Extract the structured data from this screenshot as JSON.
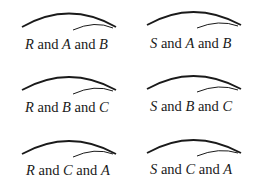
{
  "diagram": {
    "cells": [
      {
        "first": "R",
        "joiner1": " and ",
        "second": "A",
        "joiner2": " and ",
        "third": "B"
      },
      {
        "first": "S",
        "joiner1": " and ",
        "second": "A",
        "joiner2": " and ",
        "third": "B"
      },
      {
        "first": "R",
        "joiner1": " and ",
        "second": "B",
        "joiner2": " and ",
        "third": "C"
      },
      {
        "first": "S",
        "joiner1": " and ",
        "second": "B",
        "joiner2": " and ",
        "third": "C"
      },
      {
        "first": "R",
        "joiner1": " and ",
        "second": "C",
        "joiner2": " and ",
        "third": "A"
      },
      {
        "first": "S",
        "joiner1": " and ",
        "second": "C",
        "joiner2": " and ",
        "third": "A"
      }
    ],
    "colors": {
      "stroke": "#1a1a1a",
      "background": "#ffffff"
    }
  }
}
